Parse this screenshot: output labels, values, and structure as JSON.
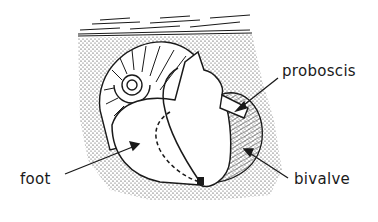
{
  "diagram": {
    "labels": {
      "proboscis": "proboscis",
      "foot": "foot",
      "bivalve": "bivalve"
    },
    "colors": {
      "ink": "#1a1a1a",
      "background": "#ffffff"
    }
  }
}
